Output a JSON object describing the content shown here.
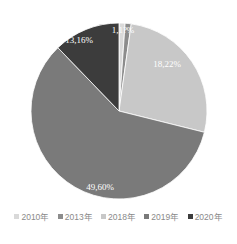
{
  "chart_data": {
    "type": "pie",
    "title": "",
    "categories": [
      "2010年",
      "2013年",
      "2018年",
      "2019年",
      "2020年"
    ],
    "values": [
      1.1,
      1.1,
      18.22,
      49.6,
      13.16
    ],
    "labels": [
      "1,1?%",
      "",
      "18,22%",
      "49,60%",
      "13,16%"
    ],
    "colors": [
      "#d9d9d9",
      "#8c8c8c",
      "#c8c8c8",
      "#7a7a7a",
      "#3c3c3c"
    ],
    "visual_angles_deg": [
      4,
      4,
      96,
      212,
      44
    ],
    "legend_position": "bottom",
    "start_angle": "12 o'clock, clockwise"
  },
  "legend": {
    "items": [
      {
        "label": "2010年",
        "color": "#d9d9d9"
      },
      {
        "label": "2013年",
        "color": "#8c8c8c"
      },
      {
        "label": "2018年",
        "color": "#c8c8c8"
      },
      {
        "label": "2019年",
        "color": "#7a7a7a"
      },
      {
        "label": "2020年",
        "color": "#3c3c3c"
      }
    ]
  }
}
